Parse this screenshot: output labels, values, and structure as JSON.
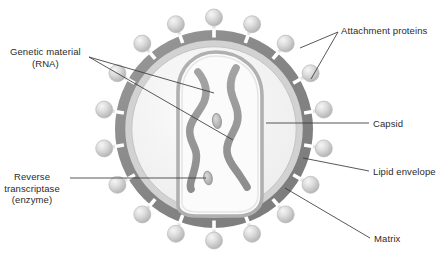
{
  "diagram": {
    "background_color": "#ffffff",
    "colors": {
      "envelope_ring": "#8c8c8c",
      "envelope_ring_dark": "#787878",
      "matrix_band": "#cfcfcf",
      "interior": "#f2f2f2",
      "capsid_outline": "#a8a8a8",
      "capsid_fill": "#fafafa",
      "rna": "#9a9a9a",
      "rna_dark": "#8a8a8a",
      "enzyme": "#b5b5b5",
      "sphere": "#d6d6d6",
      "sphere_highlight": "#f4f4f4",
      "stalk": "#e8e8e8",
      "leader_line": "#3a3a3a",
      "text": "#2b2b2b"
    },
    "structure": {
      "center_x": 214,
      "center_y": 129,
      "envelope_outer_radius": 99,
      "envelope_inner_radius": 88,
      "matrix_radius": 82,
      "attachment_protein_count": 18,
      "sphere_radius": 8.5,
      "rna_strand_count": 2,
      "enzyme_count": 2
    }
  },
  "labels": [
    {
      "id": "attachment-proteins",
      "text": "Attachment proteins",
      "x": 341,
      "y": 25,
      "align": "left",
      "leader_from": [
        338,
        32
      ],
      "leader_to": [
        [
          300,
          48
        ],
        [
          311,
          79
        ]
      ]
    },
    {
      "id": "genetic-material",
      "text_lines": [
        "Genetic material",
        "(RNA)"
      ],
      "line1": "Genetic material",
      "line2": "(RNA)",
      "x": 10,
      "y": 46,
      "align": "left",
      "leader_from": [
        89,
        57
      ],
      "leader_to": [
        [
          214,
          93
        ],
        [
          233,
          140
        ]
      ]
    },
    {
      "id": "reverse-transcriptase",
      "text_lines": [
        "Reverse",
        "transcriptase",
        "(enzyme)"
      ],
      "line1": "Reverse",
      "line2": "transcriptase",
      "line3": "(enzyme)",
      "x": 6,
      "y": 171,
      "align": "right",
      "leader_from": [
        70,
        178
      ],
      "leader_to": [
        [
          206,
          178
        ]
      ]
    },
    {
      "id": "capsid",
      "text": "Capsid",
      "x": 373,
      "y": 118,
      "align": "left",
      "leader_from": [
        369,
        123
      ],
      "leader_to": [
        [
          266,
          123
        ]
      ]
    },
    {
      "id": "lipid-envelope",
      "text": "Lipid envelope",
      "x": 373,
      "y": 166,
      "align": "left",
      "leader_from": [
        369,
        171
      ],
      "leader_to": [
        [
          303,
          158
        ]
      ]
    },
    {
      "id": "matrix",
      "text": "Matrix",
      "x": 374,
      "y": 233,
      "align": "left",
      "leader_from": [
        370,
        238
      ],
      "leader_to": [
        [
          285,
          188
        ]
      ]
    }
  ]
}
